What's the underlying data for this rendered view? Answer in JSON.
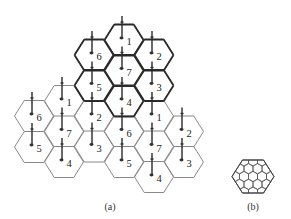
{
  "figure": {
    "panel_a": {
      "caption": "(a)",
      "cells": [
        {
          "label": "6",
          "col": 0,
          "cx": 34,
          "cy": 116,
          "cluster": "left"
        },
        {
          "label": "5",
          "col": 0,
          "cx": 34,
          "cy": 147,
          "cluster": "left"
        },
        {
          "label": "1",
          "col": 1,
          "cx": 64,
          "cy": 101,
          "cluster": "left"
        },
        {
          "label": "7",
          "col": 1,
          "cx": 64,
          "cy": 131.5,
          "cluster": "left"
        },
        {
          "label": "4",
          "col": 1,
          "cx": 64,
          "cy": 162,
          "cluster": "left"
        },
        {
          "label": "6",
          "col": 2,
          "cx": 94,
          "cy": 55,
          "cluster": "top"
        },
        {
          "label": "5",
          "col": 2,
          "cx": 94,
          "cy": 85.5,
          "cluster": "top"
        },
        {
          "label": "2",
          "col": 2,
          "cx": 94,
          "cy": 116,
          "cluster": "left"
        },
        {
          "label": "3",
          "col": 2,
          "cx": 94,
          "cy": 146.5,
          "cluster": "left"
        },
        {
          "label": "1",
          "col": 3,
          "cx": 124,
          "cy": 40,
          "cluster": "top"
        },
        {
          "label": "7",
          "col": 3,
          "cx": 124,
          "cy": 70.5,
          "cluster": "top"
        },
        {
          "label": "4",
          "col": 3,
          "cx": 124,
          "cy": 101,
          "cluster": "top"
        },
        {
          "label": "6",
          "col": 3,
          "cx": 124,
          "cy": 131.5,
          "cluster": "right"
        },
        {
          "label": "5",
          "col": 3,
          "cx": 124,
          "cy": 162,
          "cluster": "right"
        },
        {
          "label": "2",
          "col": 4,
          "cx": 154,
          "cy": 55,
          "cluster": "top"
        },
        {
          "label": "3",
          "col": 4,
          "cx": 154,
          "cy": 85.5,
          "cluster": "top"
        },
        {
          "label": "1",
          "col": 4,
          "cx": 154,
          "cy": 116,
          "cluster": "right"
        },
        {
          "label": "7",
          "col": 4,
          "cx": 154,
          "cy": 146.5,
          "cluster": "right"
        },
        {
          "label": "4",
          "col": 4,
          "cx": 154,
          "cy": 177,
          "cluster": "right"
        },
        {
          "label": "2",
          "col": 5,
          "cx": 184,
          "cy": 131.5,
          "cluster": "right"
        },
        {
          "label": "3",
          "col": 5,
          "cx": 184,
          "cy": 162,
          "cluster": "right"
        }
      ],
      "highlighted_cluster": "top",
      "cell_radius": 19.5,
      "cell_half_height": 15.5
    },
    "panel_b": {
      "caption": "(b)",
      "outer_center": [
        253,
        176.5
      ],
      "outer_radius": 21,
      "outer_half_height": 16.5
    },
    "colors": {
      "edge": "#7a7a7a",
      "cluster_outline": "#2a2a2a",
      "antenna": "#2a2a2a",
      "label": "#222222"
    }
  }
}
